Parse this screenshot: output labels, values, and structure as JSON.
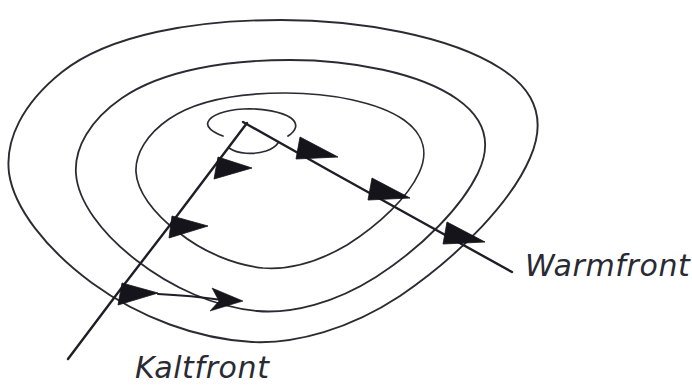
{
  "figure": {
    "kind": "hand-drawn-weather-diagram",
    "background_color": "#ffffff",
    "ink_color": "#2a2a33",
    "barb_fill_color": "#14141a"
  },
  "labels": {
    "warm_front": "Warmfront",
    "cold_front": "Kaltfront"
  },
  "label_positions": {
    "warm_front": {
      "x": 525,
      "y": 276,
      "font_size": 30
    },
    "cold_front": {
      "x": 135,
      "y": 378,
      "font_size": 30
    }
  },
  "isobars": {
    "count": 4,
    "description": "vier geschachtelte Isobaren-Ellipsen in Perspektive",
    "rings": [
      {
        "name": "isobar-outer",
        "index": 1,
        "stroke_width": 1.9
      },
      {
        "name": "isobar-second",
        "index": 2,
        "stroke_width": 1.8
      },
      {
        "name": "isobar-third",
        "index": 3,
        "stroke_width": 1.7
      },
      {
        "name": "isobar-inner",
        "index": 4,
        "stroke_width": 1.7
      },
      {
        "name": "isobar-center-arc",
        "index": 5,
        "stroke_width": 1.7
      }
    ]
  },
  "fronts": {
    "cold": {
      "name": "Kaltfront",
      "symbol": "filled-triangles",
      "barb_count": 3,
      "barb_direction": "east",
      "start": {
        "x": 247,
        "y": 123
      },
      "end": {
        "x": 68,
        "y": 359
      }
    },
    "warm": {
      "name": "Warmfront",
      "symbol": "filled-triangles",
      "barb_count": 3,
      "barb_direction": "northwest",
      "start": {
        "x": 243,
        "y": 122
      },
      "end": {
        "x": 512,
        "y": 272
      }
    }
  },
  "motion_arrow": {
    "name": "movement-arrow",
    "direction": "east",
    "start": {
      "x": 158,
      "y": 297
    },
    "end": {
      "x": 238,
      "y": 300
    }
  }
}
